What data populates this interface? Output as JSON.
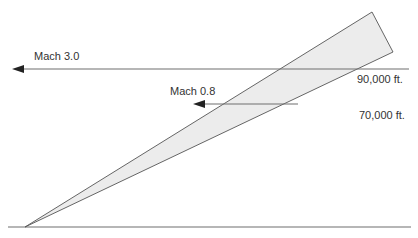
{
  "diagram": {
    "arrows": [
      {
        "label": "Mach 3.0",
        "speed": 3.0
      },
      {
        "label": "Mach 0.8",
        "speed": 0.8
      }
    ],
    "altitudes": [
      {
        "label": "90,000 ft."
      },
      {
        "label": "70,000 ft."
      }
    ],
    "colors": {
      "line": "#6e6e6e",
      "wedge_fill": "#ececec",
      "wedge_stroke": "#555555",
      "text": "#333333"
    }
  }
}
